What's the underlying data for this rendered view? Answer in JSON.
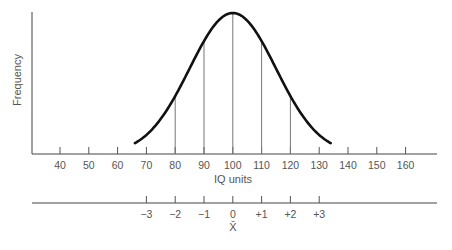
{
  "chart_data": {
    "type": "line",
    "title": "",
    "xlabel": "IQ units",
    "ylabel": "Frequency",
    "distribution": {
      "kind": "normal",
      "mean": 100,
      "sd": 15
    },
    "x_ticks": [
      40,
      50,
      60,
      70,
      80,
      90,
      100,
      110,
      120,
      130,
      140,
      150,
      160
    ],
    "x_tick_labels": [
      "40",
      "50",
      "60",
      "70",
      "80",
      "90",
      "100",
      "110",
      "120",
      "130",
      "140",
      "150",
      "160"
    ],
    "curve_range": [
      66,
      134
    ],
    "vertical_lines_at": [
      80,
      90,
      100,
      110,
      120
    ],
    "xlim": [
      30,
      170
    ],
    "grid": false,
    "legend": null,
    "secondary_axis": {
      "label": "X̄",
      "ticks": [
        70,
        80,
        90,
        100,
        110,
        120,
        130
      ],
      "tick_labels": [
        "−3",
        "−2",
        "−1",
        "0",
        "+1",
        "+2",
        "+3"
      ]
    }
  },
  "colors": {
    "curve": "#111111",
    "axis": "#444444",
    "guide_lines": "#777777",
    "text": "#555555"
  }
}
